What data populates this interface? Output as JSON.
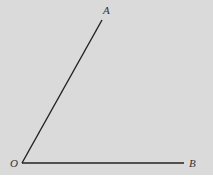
{
  "diagram": {
    "type": "angle",
    "background_color": "#dadada",
    "line_color": "#222222",
    "points": {
      "O": {
        "label": "O",
        "x": 22,
        "y": 163
      },
      "A": {
        "label": "A",
        "x": 102,
        "y": 20
      },
      "B": {
        "label": "B",
        "x": 184,
        "y": 163
      }
    },
    "rays": [
      {
        "from": "O",
        "to": "A"
      },
      {
        "from": "O",
        "to": "B"
      }
    ]
  }
}
